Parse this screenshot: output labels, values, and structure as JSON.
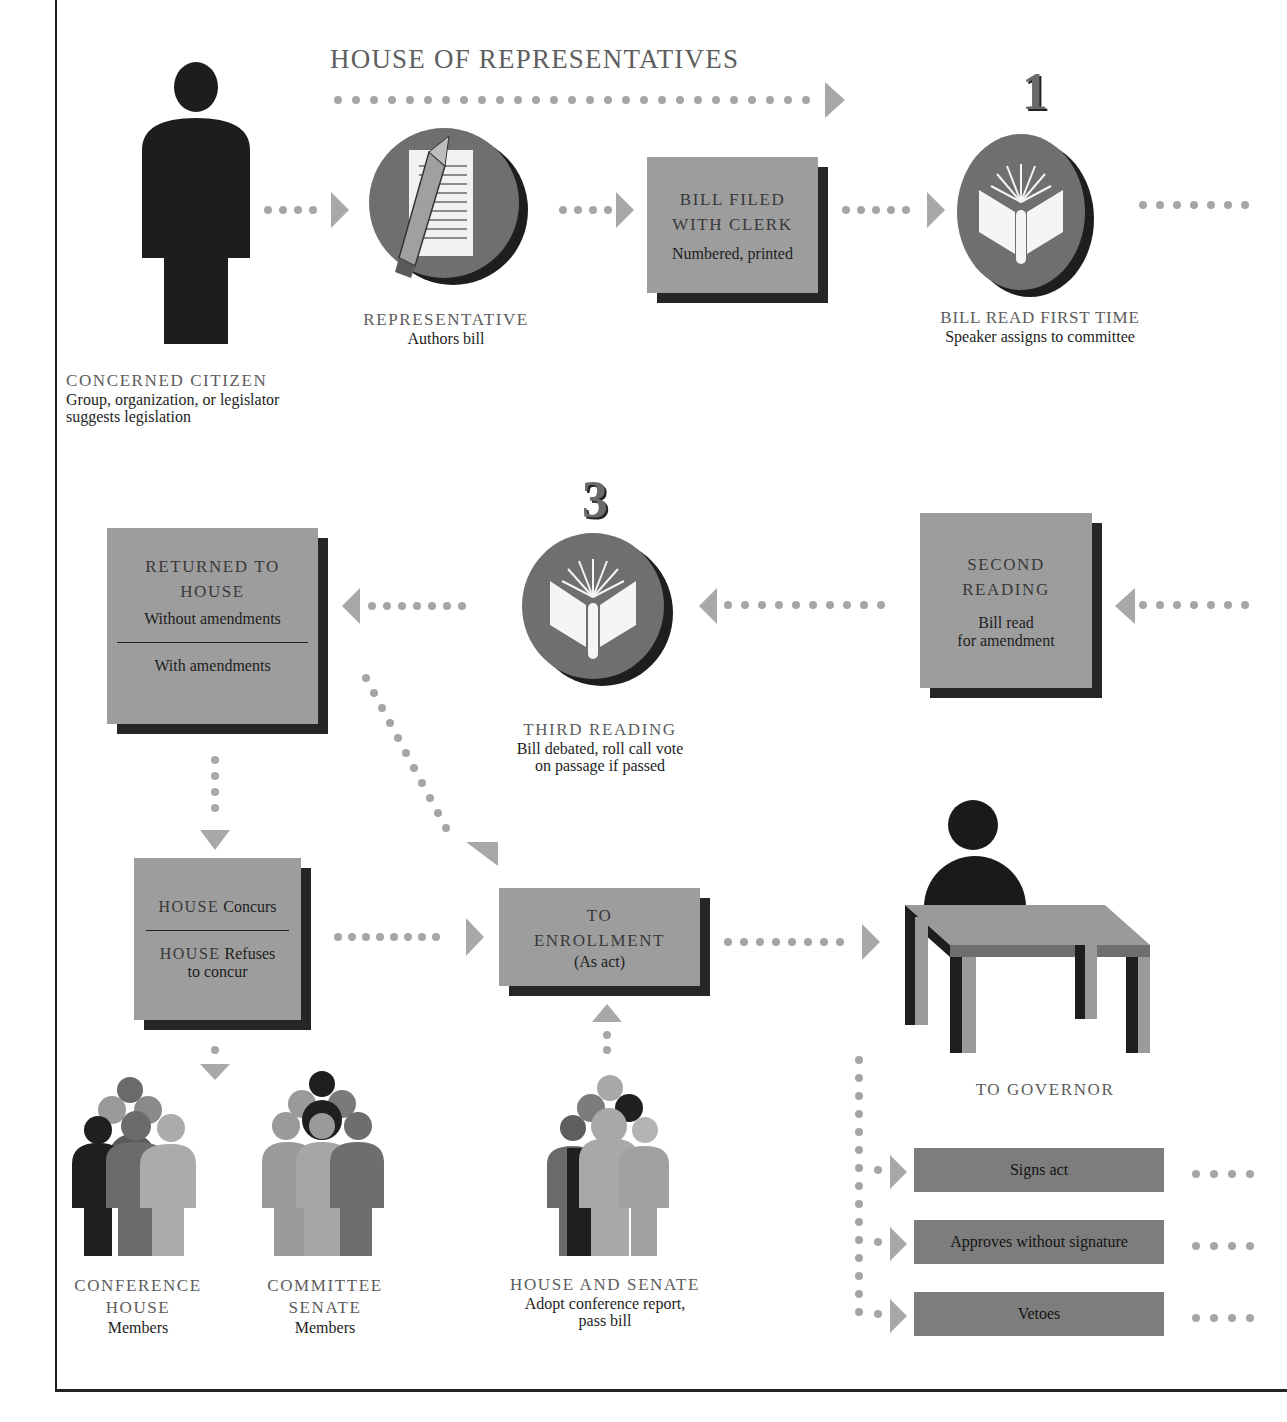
{
  "diagram": {
    "title": "HOUSE OF REPRESENTATIVES",
    "colors": {
      "box_fill": "#9d9d9d",
      "box_shadow": "#262626",
      "circle_fill": "#6f6f6f",
      "dots": "#a6a6a6",
      "arrow": "#a8a8a8",
      "governor_bar": "#7d7d7d",
      "heading_text": "#5c5c5c"
    },
    "step_numbers": {
      "first": "1",
      "third": "3"
    },
    "nodes": {
      "citizen": {
        "heading": "CONCERNED CITIZEN",
        "line1": "Group, organization, or legislator",
        "line2": "suggests legislation"
      },
      "representative": {
        "heading": "REPRESENTATIVE",
        "sub": "Authors bill"
      },
      "bill_filed": {
        "heading1": "BILL FILED",
        "heading2": "WITH CLERK",
        "sub": "Numbered, printed"
      },
      "first_reading": {
        "heading": "BILL READ FIRST TIME",
        "sub": "Speaker assigns to committee"
      },
      "second_reading": {
        "heading1": "SECOND",
        "heading2": "READING",
        "sub1": "Bill read",
        "sub2": "for amendment"
      },
      "third_reading": {
        "heading": "THIRD READING",
        "sub1": "Bill debated, roll call vote",
        "sub2": "on passage if passed"
      },
      "returned": {
        "heading1": "RETURNED TO",
        "heading2": "HOUSE",
        "option1": "Without amendments",
        "option2": "With amendments"
      },
      "house_concurs": {
        "house1": "HOUSE",
        "label1": "Concurs",
        "house2": "HOUSE",
        "label2": "Refuses",
        "label3": "to concur"
      },
      "enrollment": {
        "heading1": "TO",
        "heading2": "ENROLLMENT",
        "sub": "(As act)"
      },
      "conference_house": {
        "heading1": "CONFERENCE",
        "heading2": "HOUSE",
        "sub": "Members"
      },
      "committee_senate": {
        "heading1": "COMMITTEE",
        "heading2": "SENATE",
        "sub": "Members"
      },
      "house_and_senate": {
        "heading": "HOUSE AND SENATE",
        "sub1": "Adopt conference report,",
        "sub2": "pass bill"
      },
      "governor": {
        "heading": "TO GOVERNOR"
      }
    },
    "governor_actions": [
      "Signs act",
      "Approves without signature",
      "Vetoes"
    ]
  }
}
